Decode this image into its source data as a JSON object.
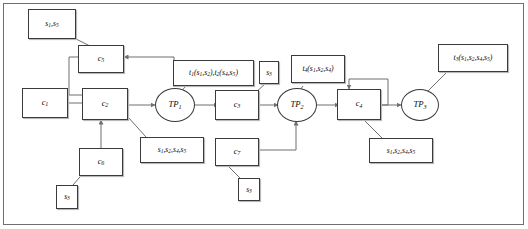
{
  "diagram": {
    "colors": {
      "stroke": "#3a3a3a",
      "wire": "#6f6f6f",
      "frame": "#6f6f6f",
      "text": "#0b0b0b",
      "background": "#ffffff",
      "shadow": "#b9b9b9"
    },
    "nodes": {
      "s1s5_top": {
        "label": "s1,s5",
        "shape": "box"
      },
      "c5": {
        "label": "c5",
        "shape": "box"
      },
      "c1": {
        "label": "c1",
        "shape": "box"
      },
      "c2": {
        "label": "c2",
        "shape": "box"
      },
      "tp1": {
        "label": "TP1",
        "shape": "ellipse"
      },
      "t1t2": {
        "label": "t1(s1,s2),t2(s4,s5)",
        "shape": "box"
      },
      "s3_mid": {
        "label": "s3",
        "shape": "box"
      },
      "c3": {
        "label": "c3",
        "shape": "box"
      },
      "tp2": {
        "label": "TP2",
        "shape": "ellipse"
      },
      "t4": {
        "label": "t4(s1,s2,s4)",
        "shape": "box"
      },
      "c4": {
        "label": "c4",
        "shape": "box"
      },
      "tp3": {
        "label": "TP3",
        "shape": "ellipse"
      },
      "t3": {
        "label": "t3(s1,s2,s4,s5)",
        "shape": "box"
      },
      "s_c2_note": {
        "label": "s1,s2,s4,s5",
        "shape": "box"
      },
      "s_c4_note": {
        "label": "s1,s2,s4,s5",
        "shape": "box"
      },
      "c6": {
        "label": "c6",
        "shape": "box"
      },
      "s3_bottom_left": {
        "label": "s3",
        "shape": "box"
      },
      "c7": {
        "label": "c7",
        "shape": "box"
      },
      "s3_bottom_mid": {
        "label": "s3",
        "shape": "box"
      }
    }
  }
}
